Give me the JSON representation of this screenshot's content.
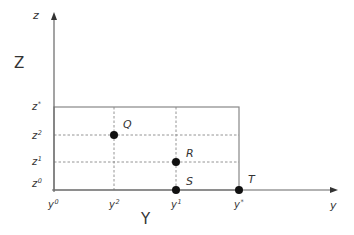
{
  "diagram": {
    "axes": {
      "vertical": {
        "name": "z",
        "title": "Z"
      },
      "horizontal": {
        "name": "y",
        "title": "Y"
      }
    },
    "z_ticks": [
      {
        "base": "z",
        "sup": "*"
      },
      {
        "base": "z",
        "sup": "2"
      },
      {
        "base": "z",
        "sup": "1"
      },
      {
        "base": "z",
        "sup": "0"
      }
    ],
    "y_ticks": [
      {
        "base": "y",
        "sup": "0"
      },
      {
        "base": "y",
        "sup": "2"
      },
      {
        "base": "y",
        "sup": "1"
      },
      {
        "base": "y",
        "sup": "*"
      }
    ],
    "points": [
      {
        "label": "Q",
        "y": "y2",
        "z": "z2"
      },
      {
        "label": "R",
        "y": "y1",
        "z": "z1"
      },
      {
        "label": "S",
        "y": "y1",
        "z": "z0"
      },
      {
        "label": "T",
        "y": "y*",
        "z": "z0"
      }
    ],
    "colors": {
      "axis": "#666666",
      "rect": "#777777",
      "dashed": "#888888",
      "point": "#111111",
      "text": "#333333"
    }
  }
}
